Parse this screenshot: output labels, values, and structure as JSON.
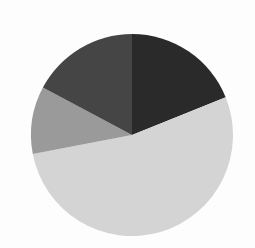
{
  "chart_data": {
    "type": "pie",
    "title": "",
    "legend": [],
    "start_angle_deg": 0,
    "direction": "clockwise",
    "slices": [
      {
        "label": "",
        "value": 18.9,
        "color": "#2a2a2a"
      },
      {
        "label": "",
        "value": 53.1,
        "color": "#d4d4d4"
      },
      {
        "label": "",
        "value": 10.8,
        "color": "#9a9a9a"
      },
      {
        "label": "",
        "value": 17.2,
        "color": "#454545"
      }
    ]
  },
  "layout": {
    "cx": 132,
    "cy": 135,
    "r": 101,
    "background": "#fdfdfd"
  }
}
